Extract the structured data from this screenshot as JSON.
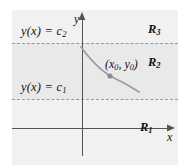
{
  "figure": {
    "background_color": "#ffffff",
    "panel_color": "#f1f1f1",
    "panel_band_color": "#e9e9e9",
    "axis_color": "#555555",
    "dashed_line_color": "#9a9a9a",
    "curve_color": "#9a9a9a",
    "point_color": "#8d8d8d",
    "text_color": "#111111"
  },
  "axes": {
    "x_label": "x",
    "y_label": "y",
    "x_axis_name": "horizontal-axis",
    "y_axis_name": "vertical-axis"
  },
  "boundaries": [
    {
      "label": "y(x) = c2",
      "label_html": "y(x) = c",
      "subscript": "2",
      "name": "equilibrium-upper"
    },
    {
      "label": "y(x) = c1",
      "label_html": "y(x) = c",
      "subscript": "1",
      "name": "equilibrium-lower"
    }
  ],
  "regions": [
    {
      "label": "R3",
      "base": "R",
      "subscript": "3",
      "name": "region-r3"
    },
    {
      "label": "R2",
      "base": "R",
      "subscript": "2",
      "name": "region-r2"
    },
    {
      "label": "R1",
      "base": "R",
      "subscript": "1",
      "name": "region-r1"
    }
  ],
  "point": {
    "label": "(x0, y0)",
    "base_open": "(",
    "x_symbol": "x",
    "x_subscript": "0",
    "separator": ", ",
    "y_symbol": "y",
    "y_subscript": "0",
    "base_close": ")"
  },
  "curve": {
    "name": "solution-curve",
    "description": "decreasing solution curve through (x0, y0) lying inside region R2"
  }
}
